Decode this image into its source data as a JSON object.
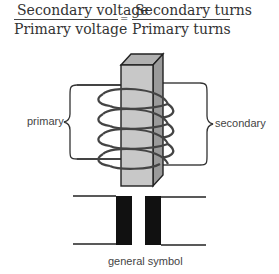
{
  "formula": {
    "left": {
      "numerator": "Secondary voltage",
      "denominator": "Primary voltage"
    },
    "equals": "=",
    "right": {
      "numerator": "Secondary turns",
      "denominator": "Primary turns"
    }
  },
  "labels": {
    "primary": "primary",
    "secondary": "secondary",
    "symbol_caption": "general symbol"
  },
  "colors": {
    "core_front": "#c8c8c8",
    "core_side": "#9a9a9a",
    "core_top": "#b0b0b0",
    "coil": "#444444",
    "ink": "#222222"
  }
}
